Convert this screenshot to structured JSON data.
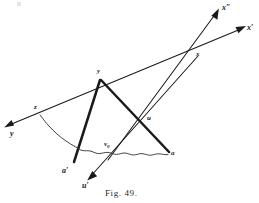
{
  "figure": {
    "caption": "Fig. 49.",
    "background_color": "#ffffff",
    "ink_color": "#1a1a1a",
    "thin_stroke_width": 1.0,
    "thick_stroke_width": 2.4,
    "curve_stroke_width": 0.9
  },
  "labels": {
    "x_double_prime": "x″",
    "x_prime": "x′",
    "x": "x",
    "y_axis_arrow": "y",
    "y_vertex": "y",
    "z": "z",
    "u": "u",
    "u_prime": "u′",
    "v_zero": "v",
    "v_zero_sub": "0",
    "a": "a",
    "a_prime": "a′"
  },
  "points": {
    "y_arrow_tip": [
      5,
      127
    ],
    "z": [
      38,
      113
    ],
    "y_vertex": [
      100,
      78
    ],
    "x": [
      198,
      55
    ],
    "x_prime_tip": [
      245,
      27
    ],
    "x_double_prime_tip": [
      218,
      9
    ],
    "u": [
      145,
      119
    ],
    "v_zero": [
      113,
      151
    ],
    "u_prime_tip": [
      88,
      179
    ],
    "a": [
      168,
      154
    ],
    "a_prime": [
      74,
      163
    ]
  },
  "segments": [
    {
      "name": "axis-y-to-x-prime",
      "kind": "thin-arrow-both",
      "from": "y_arrow_tip",
      "to": "x_prime_tip"
    },
    {
      "name": "axis-x-double-prime",
      "kind": "thin-arrow-end",
      "from": "v_zero",
      "to": "x_double_prime_tip"
    },
    {
      "name": "axis-u-prime",
      "kind": "thin-arrow-end",
      "from": "x",
      "to": "u_prime_tip"
    },
    {
      "name": "chord-y-to-a-prime",
      "kind": "thick",
      "from": "y_vertex",
      "to": "a_prime"
    },
    {
      "name": "chord-y-to-a",
      "kind": "thick",
      "from": "y_vertex",
      "to": "a"
    },
    {
      "name": "arc-z-to-a",
      "kind": "wavy-curve",
      "from": "z",
      "to": "a"
    }
  ]
}
